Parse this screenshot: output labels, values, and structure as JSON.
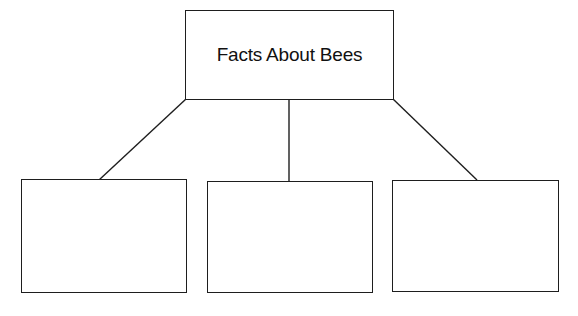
{
  "diagram": {
    "type": "tree",
    "colors": {
      "stroke": "#1e1e1e",
      "background": "#ffffff",
      "text": "#111111"
    },
    "root": {
      "label": "Facts About Bees"
    },
    "children": [
      {
        "label": ""
      },
      {
        "label": ""
      },
      {
        "label": ""
      }
    ],
    "edges": [
      {
        "from": "root",
        "to": "child-0"
      },
      {
        "from": "root",
        "to": "child-1"
      },
      {
        "from": "root",
        "to": "child-2"
      }
    ]
  }
}
